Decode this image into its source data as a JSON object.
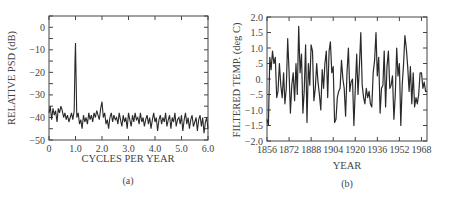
{
  "figure": {
    "panels": [
      {
        "id": "a",
        "caption": "(a)",
        "xlabel": "CYCLES PER YEAR",
        "ylabel": "RELATIVE PSD (dB)"
      },
      {
        "id": "b",
        "caption": "(b)",
        "xlabel": "YEAR",
        "ylabel": "FILTERED TEMP. (deg C)"
      }
    ]
  },
  "chart_data": [
    {
      "type": "line",
      "title": "",
      "caption": "(a)",
      "xlabel": "CYCLES PER YEAR",
      "ylabel": "RELATIVE PSD (dB)",
      "xlim": [
        0,
        6.0
      ],
      "ylim": [
        -50,
        5
      ],
      "xticks": [
        0,
        1.0,
        2.0,
        3.0,
        4.0,
        5.0,
        6.0
      ],
      "xtick_labels": [
        "0",
        "1.0",
        "2.0",
        "3.0",
        "4.0",
        "5.0",
        "6.0"
      ],
      "yticks": [
        0,
        -10,
        -20,
        -30,
        -40,
        -50
      ],
      "ytick_labels": [
        "0",
        "-10",
        "-20",
        "-30",
        "-40",
        "-50"
      ],
      "grid": false,
      "series": [
        {
          "name": "PSD",
          "x": [
            0.0,
            0.05,
            0.1,
            0.15,
            0.2,
            0.25,
            0.3,
            0.35,
            0.4,
            0.45,
            0.5,
            0.55,
            0.6,
            0.65,
            0.7,
            0.75,
            0.8,
            0.85,
            0.9,
            0.95,
            0.98,
            1.0,
            1.02,
            1.05,
            1.1,
            1.15,
            1.2,
            1.25,
            1.3,
            1.35,
            1.4,
            1.45,
            1.5,
            1.55,
            1.6,
            1.65,
            1.7,
            1.75,
            1.8,
            1.85,
            1.9,
            1.95,
            2.0,
            2.05,
            2.1,
            2.15,
            2.2,
            2.25,
            2.3,
            2.35,
            2.4,
            2.45,
            2.5,
            2.55,
            2.6,
            2.65,
            2.7,
            2.75,
            2.8,
            2.85,
            2.9,
            2.95,
            3.0,
            3.05,
            3.1,
            3.15,
            3.2,
            3.25,
            3.3,
            3.35,
            3.4,
            3.45,
            3.5,
            3.55,
            3.6,
            3.65,
            3.7,
            3.75,
            3.8,
            3.85,
            3.9,
            3.95,
            4.0,
            4.05,
            4.1,
            4.15,
            4.2,
            4.25,
            4.3,
            4.35,
            4.4,
            4.45,
            4.5,
            4.55,
            4.6,
            4.65,
            4.7,
            4.75,
            4.8,
            4.85,
            4.9,
            4.95,
            5.0,
            5.05,
            5.1,
            5.15,
            5.2,
            5.25,
            5.3,
            5.35,
            5.4,
            5.45,
            5.5,
            5.55,
            5.6,
            5.65,
            5.7,
            5.75,
            5.8,
            5.85,
            5.9,
            5.95,
            6.0
          ],
          "y": [
            -38,
            -35,
            -41,
            -36,
            -39,
            -37,
            -42,
            -36,
            -38,
            -35,
            -37,
            -40,
            -38,
            -41,
            -39,
            -42,
            -40,
            -38,
            -41,
            -37,
            -15,
            -7,
            -20,
            -40,
            -38,
            -43,
            -41,
            -45,
            -39,
            -42,
            -40,
            -43,
            -38,
            -41,
            -39,
            -42,
            -38,
            -40,
            -37,
            -39,
            -41,
            -36,
            -33,
            -40,
            -38,
            -43,
            -41,
            -45,
            -40,
            -38,
            -42,
            -39,
            -41,
            -40,
            -43,
            -38,
            -41,
            -44,
            -39,
            -42,
            -40,
            -45,
            -38,
            -41,
            -44,
            -39,
            -42,
            -38,
            -41,
            -40,
            -43,
            -38,
            -42,
            -40,
            -44,
            -41,
            -39,
            -43,
            -40,
            -45,
            -41,
            -38,
            -42,
            -40,
            -46,
            -41,
            -39,
            -43,
            -40,
            -42,
            -38,
            -44,
            -41,
            -39,
            -45,
            -40,
            -42,
            -38,
            -44,
            -41,
            -40,
            -43,
            -39,
            -46,
            -41,
            -38,
            -43,
            -40,
            -45,
            -41,
            -39,
            -44,
            -42,
            -40,
            -46,
            -41,
            -39,
            -44,
            -40,
            -47,
            -42,
            -40,
            -45,
            -41,
            -44
          ]
        }
      ]
    },
    {
      "type": "line",
      "title": "",
      "caption": "(b)",
      "xlabel": "YEAR",
      "ylabel": "FILTERED TEMP. (deg C)",
      "xlim": [
        1856,
        1972
      ],
      "ylim": [
        -2.0,
        2.0
      ],
      "xticks": [
        1856,
        1872,
        1888,
        1904,
        1920,
        1936,
        1952,
        1968
      ],
      "xtick_labels": [
        "1856",
        "1872",
        "1888",
        "1904",
        "1920",
        "1936",
        "1952",
        "1968"
      ],
      "yticks": [
        2.0,
        1.5,
        1.0,
        0.5,
        0.0,
        -0.5,
        -1.0,
        -1.5,
        -2.0
      ],
      "ytick_labels": [
        "2.0",
        "1.5",
        "1.0",
        ".5",
        "0.",
        "-.5",
        "-1.0",
        "-1.5",
        "-2.0"
      ],
      "grid": false,
      "series": [
        {
          "name": "Filtered temperature",
          "x": [
            1856,
            1857,
            1858,
            1859,
            1860,
            1861,
            1862,
            1863,
            1864,
            1865,
            1866,
            1867,
            1868,
            1869,
            1870,
            1871,
            1872,
            1873,
            1874,
            1875,
            1876,
            1877,
            1878,
            1879,
            1880,
            1881,
            1882,
            1883,
            1884,
            1885,
            1886,
            1887,
            1888,
            1889,
            1890,
            1891,
            1892,
            1893,
            1894,
            1895,
            1896,
            1897,
            1898,
            1899,
            1900,
            1901,
            1902,
            1903,
            1904,
            1905,
            1906,
            1907,
            1908,
            1909,
            1910,
            1911,
            1912,
            1913,
            1914,
            1915,
            1916,
            1917,
            1918,
            1919,
            1920,
            1921,
            1922,
            1923,
            1924,
            1925,
            1926,
            1927,
            1928,
            1929,
            1930,
            1931,
            1932,
            1933,
            1934,
            1935,
            1936,
            1937,
            1938,
            1939,
            1940,
            1941,
            1942,
            1943,
            1944,
            1945,
            1946,
            1947,
            1948,
            1949,
            1950,
            1951,
            1952,
            1953,
            1954,
            1955,
            1956,
            1957,
            1958,
            1959,
            1960,
            1961,
            1962,
            1963,
            1964,
            1965,
            1966,
            1967,
            1968,
            1969,
            1970,
            1971,
            1972
          ],
          "y": [
            -1.3,
            -1.5,
            0.7,
            0.3,
            0.9,
            0.5,
            0.7,
            -0.6,
            -0.4,
            0.5,
            -0.2,
            -0.6,
            0.2,
            -0.8,
            -0.3,
            1.3,
            0.2,
            -1.1,
            -0.2,
            0.2,
            -0.7,
            0.5,
            -0.5,
            1.7,
            0.2,
            0.8,
            -1.1,
            -0.4,
            1.1,
            -1.4,
            0.5,
            -0.2,
            1.1,
            0.9,
            -0.7,
            -0.3,
            0.5,
            -0.1,
            -0.5,
            -1.0,
            0.3,
            -0.3,
            0.5,
            0.9,
            -0.6,
            0.9,
            1.2,
            0.2,
            0.4,
            -1.4,
            -1.3,
            -0.6,
            -0.4,
            -0.3,
            0.6,
            0.0,
            -0.3,
            -1.2,
            0.2,
            1.0,
            -0.4,
            -0.1,
            0.0,
            -1.5,
            -0.3,
            0.8,
            -0.5,
            0.4,
            1.5,
            -0.2,
            -0.6,
            -0.8,
            -0.3,
            -0.6,
            -0.4,
            -0.8,
            -0.9,
            0.2,
            0.6,
            1.5,
            0.1,
            0.7,
            -1.1,
            -0.3,
            -0.2,
            0.9,
            -0.9,
            0.4,
            0.9,
            -0.3,
            -0.2,
            0.1,
            -1.3,
            -0.5,
            1.0,
            0.1,
            0.5,
            -1.5,
            -0.2,
            0.5,
            1.4,
            1.0,
            0.4,
            -0.4,
            0.4,
            -0.8,
            0.2,
            -0.9,
            -0.6,
            -0.8,
            -0.5,
            0.2,
            0.2,
            -0.3,
            -0.1,
            -0.4,
            -0.4
          ]
        }
      ]
    }
  ]
}
